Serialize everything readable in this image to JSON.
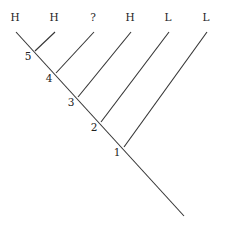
{
  "diagram": {
    "type": "cladogram",
    "tips": [
      {
        "label": "H",
        "x": 16,
        "y": 32
      },
      {
        "label": "H",
        "x": 55,
        "y": 32
      },
      {
        "label": "?",
        "x": 94,
        "y": 32
      },
      {
        "label": "H",
        "x": 131,
        "y": 32
      },
      {
        "label": "L",
        "x": 169,
        "y": 32
      },
      {
        "label": "L",
        "x": 207,
        "y": 32
      }
    ],
    "nodes": [
      {
        "label": "5",
        "x": 35,
        "y": 51
      },
      {
        "label": "4",
        "x": 56,
        "y": 73
      },
      {
        "label": "3",
        "x": 78,
        "y": 97
      },
      {
        "label": "2",
        "x": 101,
        "y": 122
      },
      {
        "label": "1",
        "x": 124,
        "y": 147
      }
    ],
    "root": {
      "x": 184,
      "y": 216
    },
    "edges": [
      {
        "from": "tip0",
        "to": "root"
      },
      {
        "from": "tip1",
        "to": "node5"
      },
      {
        "from": "tip2",
        "to": "node4"
      },
      {
        "from": "tip3",
        "to": "node3"
      },
      {
        "from": "tip4",
        "to": "node2"
      },
      {
        "from": "tip5",
        "to": "node1"
      }
    ]
  }
}
